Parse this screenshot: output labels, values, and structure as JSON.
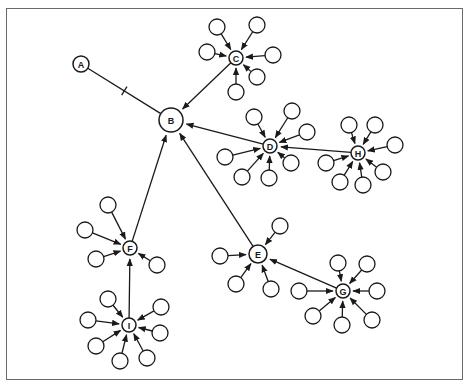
{
  "diagram": {
    "type": "directed-network",
    "colors": {
      "stroke": "#1a1a1a",
      "frame": "#6a6a6a",
      "background": "#ffffff"
    },
    "hubs": [
      {
        "id": "A",
        "label": "A",
        "x": 81,
        "y": 64,
        "r": 8
      },
      {
        "id": "B",
        "label": "B",
        "x": 171,
        "y": 120,
        "r": 12
      },
      {
        "id": "C",
        "label": "C",
        "x": 236,
        "y": 58,
        "r": 7
      },
      {
        "id": "D",
        "label": "D",
        "x": 270,
        "y": 146,
        "r": 7
      },
      {
        "id": "H",
        "label": "H",
        "x": 358,
        "y": 153,
        "r": 7
      },
      {
        "id": "E",
        "label": "E",
        "x": 258,
        "y": 254,
        "r": 9
      },
      {
        "id": "G",
        "label": "G",
        "x": 343,
        "y": 291,
        "r": 7
      },
      {
        "id": "F",
        "label": "F",
        "x": 130,
        "y": 248,
        "r": 7
      },
      {
        "id": "I",
        "label": "I",
        "x": 129,
        "y": 325,
        "r": 7
      }
    ],
    "hub_edges": [
      {
        "from": "A",
        "to": "B",
        "style": "tick"
      },
      {
        "from": "C",
        "to": "B",
        "style": "arrow"
      },
      {
        "from": "D",
        "to": "B",
        "style": "arrow"
      },
      {
        "from": "H",
        "to": "D",
        "style": "arrow"
      },
      {
        "from": "E",
        "to": "B",
        "style": "arrow"
      },
      {
        "from": "G",
        "to": "E",
        "style": "arrow"
      },
      {
        "from": "F",
        "to": "B",
        "style": "arrow"
      },
      {
        "from": "I",
        "to": "F",
        "style": "arrow"
      }
    ],
    "satellites": {
      "C": [
        [
          217,
          27
        ],
        [
          257,
          25
        ],
        [
          207,
          52
        ],
        [
          273,
          55
        ],
        [
          257,
          77
        ],
        [
          236,
          92
        ]
      ],
      "D": [
        [
          254,
          117
        ],
        [
          292,
          111
        ],
        [
          307,
          132
        ],
        [
          225,
          157
        ],
        [
          242,
          177
        ],
        [
          269,
          178
        ],
        [
          291,
          163
        ]
      ],
      "H": [
        [
          349,
          125
        ],
        [
          375,
          125
        ],
        [
          395,
          145
        ],
        [
          326,
          163
        ],
        [
          340,
          182
        ],
        [
          363,
          185
        ],
        [
          383,
          172
        ]
      ],
      "E": [
        [
          280,
          226
        ],
        [
          220,
          256
        ],
        [
          236,
          284
        ],
        [
          271,
          289
        ]
      ],
      "G": [
        [
          338,
          263
        ],
        [
          367,
          264
        ],
        [
          377,
          291
        ],
        [
          299,
          291
        ],
        [
          313,
          316
        ],
        [
          342,
          325
        ],
        [
          372,
          320
        ]
      ],
      "F": [
        [
          108,
          205
        ],
        [
          85,
          230
        ],
        [
          96,
          259
        ],
        [
          157,
          265
        ]
      ],
      "I": [
        [
          108,
          299
        ],
        [
          88,
          320
        ],
        [
          96,
          346
        ],
        [
          120,
          361
        ],
        [
          147,
          358
        ],
        [
          160,
          333
        ],
        [
          161,
          307
        ]
      ]
    },
    "satellite_radius": 8
  }
}
